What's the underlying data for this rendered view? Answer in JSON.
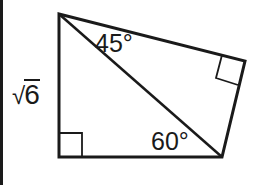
{
  "figure": {
    "type": "quadrilateral split by a diagonal into two right triangles",
    "stroke_color": "#1a1a1a",
    "background_color": "#ffffff",
    "vertices": {
      "top_left": [
        59,
        14
      ],
      "right": [
        245,
        61
      ],
      "bottom_right": [
        222,
        157
      ],
      "bottom_left": [
        59,
        157
      ]
    },
    "right_angle_markers": [
      {
        "location": "bottom_left",
        "size": 23
      },
      {
        "location": "right",
        "size": 23
      }
    ]
  },
  "labels": {
    "side_left": {
      "radical_symbol": "√",
      "radicand": "6"
    },
    "angle_top": "45°",
    "angle_bottom": "60°"
  }
}
